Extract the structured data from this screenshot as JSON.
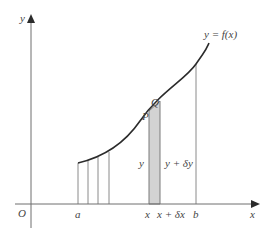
{
  "diagram": {
    "colors": {
      "axis": "#6e6e6e",
      "curve": "#2b2b2b",
      "line": "#8a8a8a",
      "strip_fill": "#d3d3d3",
      "text": "#444444"
    },
    "labels": {
      "y_axis": "y",
      "x_axis": "x",
      "origin": "O",
      "curve": "y = f(x)",
      "point_p": "P",
      "point_q": "Q",
      "tick_a": "a",
      "tick_x": "x",
      "tick_x_dx": "x + δx",
      "tick_b": "b",
      "height_y": "y",
      "height_y_dy": "y + δy"
    }
  }
}
